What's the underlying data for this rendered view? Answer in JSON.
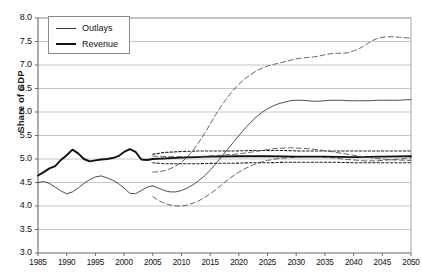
{
  "chart_data": {
    "type": "line",
    "title": "",
    "xlabel": "",
    "ylabel": "Share of GDP",
    "xlim": [
      1985,
      2050
    ],
    "ylim": [
      3.0,
      8.0
    ],
    "ytick_labels": [
      "3.0",
      "3.5",
      "4.0",
      "4.5",
      "5.0",
      "5.5",
      "6.0",
      "6.5",
      "7.0",
      "7.5",
      "8.0"
    ],
    "ytick_values": [
      3.0,
      3.5,
      4.0,
      4.5,
      5.0,
      5.5,
      6.0,
      6.5,
      7.0,
      7.5,
      8.0
    ],
    "xtick_labels": [
      "1985",
      "1990",
      "1995",
      "2000",
      "2005",
      "2010",
      "2015",
      "2020",
      "2025",
      "2030",
      "2035",
      "2040",
      "2045",
      "2050"
    ],
    "xtick_values": [
      1985,
      1990,
      1995,
      2000,
      2005,
      2010,
      2015,
      2020,
      2025,
      2030,
      2035,
      2040,
      2045,
      2050
    ],
    "grid": true,
    "legend_position": "top-left",
    "legend": [
      {
        "label": "Outlays",
        "style": "thin-solid",
        "color": "#333333"
      },
      {
        "label": "Revenue",
        "style": "thick-solid",
        "color": "#111111"
      }
    ],
    "series": [
      {
        "name": "Outlays",
        "style": "thin-solid",
        "color": "#3a3a3a",
        "x": [
          1985,
          1986,
          1987,
          1988,
          1989,
          1990,
          1991,
          1992,
          1993,
          1994,
          1995,
          1996,
          1997,
          1998,
          1999,
          2000,
          2001,
          2002,
          2003,
          2004,
          2005
        ],
        "values": [
          4.5,
          4.52,
          4.48,
          4.4,
          4.32,
          4.26,
          4.3,
          4.38,
          4.48,
          4.56,
          4.62,
          4.64,
          4.6,
          4.55,
          4.48,
          4.38,
          4.27,
          4.26,
          4.33,
          4.4,
          4.43
        ]
      },
      {
        "name": "Outlays projected (mid)",
        "style": "thin-solid",
        "color": "#3a3a3a",
        "x": [
          2005,
          2006,
          2007,
          2008,
          2009,
          2010,
          2011,
          2012,
          2013,
          2014,
          2015,
          2016,
          2017,
          2018,
          2019,
          2020,
          2021,
          2022,
          2023,
          2024,
          2025,
          2026,
          2027,
          2028,
          2029,
          2030,
          2031,
          2032,
          2033,
          2034,
          2035,
          2036,
          2037,
          2038,
          2039,
          2040,
          2041,
          2042,
          2043,
          2044,
          2045,
          2046,
          2047,
          2048,
          2049,
          2050
        ],
        "values": [
          4.43,
          4.38,
          4.33,
          4.3,
          4.3,
          4.33,
          4.38,
          4.45,
          4.54,
          4.64,
          4.76,
          4.9,
          5.05,
          5.2,
          5.35,
          5.5,
          5.64,
          5.77,
          5.89,
          5.99,
          6.07,
          6.13,
          6.18,
          6.21,
          6.24,
          6.25,
          6.25,
          6.24,
          6.23,
          6.23,
          6.24,
          6.25,
          6.25,
          6.25,
          6.24,
          6.24,
          6.24,
          6.24,
          6.24,
          6.25,
          6.25,
          6.25,
          6.25,
          6.25,
          6.26,
          6.26
        ]
      },
      {
        "name": "Outlays projected upper (dashed)",
        "style": "long-dash",
        "color": "#555555",
        "x": [
          2005,
          2006,
          2007,
          2008,
          2009,
          2010,
          2011,
          2012,
          2013,
          2014,
          2015,
          2016,
          2017,
          2018,
          2019,
          2020,
          2021,
          2022,
          2023,
          2024,
          2025,
          2026,
          2027,
          2028,
          2029,
          2030,
          2031,
          2032,
          2033,
          2034,
          2035,
          2036,
          2037,
          2038,
          2039,
          2040,
          2041,
          2042,
          2043,
          2044,
          2045,
          2046,
          2047,
          2048,
          2049,
          2050
        ],
        "values": [
          4.72,
          4.73,
          4.75,
          4.79,
          4.85,
          4.93,
          5.04,
          5.18,
          5.35,
          5.54,
          5.74,
          5.95,
          6.14,
          6.31,
          6.46,
          6.59,
          6.7,
          6.79,
          6.87,
          6.93,
          6.98,
          7.01,
          7.04,
          7.07,
          7.1,
          7.13,
          7.15,
          7.16,
          7.17,
          7.19,
          7.22,
          7.24,
          7.25,
          7.25,
          7.26,
          7.3,
          7.35,
          7.42,
          7.5,
          7.56,
          7.59,
          7.6,
          7.6,
          7.59,
          7.58,
          7.57
        ]
      },
      {
        "name": "Outlays projected lower (dashed)",
        "style": "long-dash",
        "color": "#555555",
        "x": [
          2005,
          2006,
          2007,
          2008,
          2009,
          2010,
          2011,
          2012,
          2013,
          2014,
          2015,
          2016,
          2017,
          2018,
          2019,
          2020,
          2021,
          2022,
          2023,
          2024,
          2025,
          2026,
          2027,
          2028,
          2029,
          2030,
          2031,
          2032,
          2033,
          2034,
          2035,
          2036,
          2037,
          2038,
          2039,
          2040,
          2041,
          2042,
          2043,
          2044,
          2045,
          2046,
          2047,
          2048,
          2049,
          2050
        ],
        "values": [
          4.2,
          4.12,
          4.06,
          4.02,
          4.0,
          4.0,
          4.02,
          4.06,
          4.11,
          4.18,
          4.26,
          4.35,
          4.45,
          4.55,
          4.64,
          4.72,
          4.79,
          4.85,
          4.9,
          4.94,
          4.97,
          4.99,
          5.01,
          5.02,
          5.03,
          5.04,
          5.05,
          5.05,
          5.05,
          5.05,
          5.04,
          5.03,
          5.02,
          5.0,
          4.99,
          4.98,
          4.97,
          4.96,
          4.96,
          4.96,
          4.97,
          4.98,
          4.99,
          5.0,
          5.01,
          5.02
        ]
      },
      {
        "name": "Revenue",
        "style": "thick-solid",
        "color": "#111111",
        "x": [
          1985,
          1986,
          1987,
          1988,
          1989,
          1990,
          1991,
          1992,
          1993,
          1994,
          1995,
          1996,
          1997,
          1998,
          1999,
          2000,
          2001,
          2002,
          2003,
          2004,
          2005
        ],
        "values": [
          4.65,
          4.72,
          4.8,
          4.85,
          4.98,
          5.08,
          5.2,
          5.12,
          5.0,
          4.95,
          4.97,
          4.99,
          5.0,
          5.02,
          5.06,
          5.15,
          5.21,
          5.15,
          4.99,
          4.98,
          5.0
        ]
      },
      {
        "name": "Revenue projected (mid)",
        "style": "thick-solid",
        "color": "#111111",
        "x": [
          2005,
          2010,
          2015,
          2020,
          2025,
          2030,
          2035,
          2040,
          2045,
          2050
        ],
        "values": [
          5.0,
          5.03,
          5.05,
          5.06,
          5.06,
          5.05,
          5.05,
          5.04,
          5.05,
          5.06
        ]
      },
      {
        "name": "Revenue projected upper (dotted)",
        "style": "short-dash",
        "color": "#222222",
        "x": [
          2005,
          2007,
          2010,
          2013,
          2016,
          2019,
          2022,
          2025,
          2028,
          2031,
          2034,
          2037,
          2040,
          2043,
          2046,
          2050
        ],
        "values": [
          5.1,
          5.14,
          5.16,
          5.17,
          5.17,
          5.17,
          5.18,
          5.18,
          5.18,
          5.17,
          5.17,
          5.17,
          5.17,
          5.17,
          5.17,
          5.17
        ]
      },
      {
        "name": "Revenue projected lower (dotted)",
        "style": "short-dash",
        "color": "#222222",
        "x": [
          2005,
          2007,
          2010,
          2013,
          2016,
          2019,
          2022,
          2025,
          2028,
          2031,
          2034,
          2037,
          2040,
          2043,
          2046,
          2050
        ],
        "values": [
          4.92,
          4.9,
          4.9,
          4.9,
          4.91,
          4.91,
          4.92,
          4.92,
          4.93,
          4.93,
          4.93,
          4.93,
          4.92,
          4.92,
          4.92,
          4.92
        ]
      },
      {
        "name": "Revenue alt band upper (dashed)",
        "style": "long-dash",
        "color": "#555555",
        "x": [
          2005,
          2008,
          2011,
          2014,
          2017,
          2020,
          2023,
          2026,
          2029,
          2032,
          2035,
          2038,
          2041,
          2044,
          2047,
          2050
        ],
        "values": [
          5.06,
          5.05,
          5.05,
          5.06,
          5.08,
          5.11,
          5.16,
          5.22,
          5.24,
          5.22,
          5.18,
          5.12,
          5.06,
          5.01,
          4.98,
          4.97
        ]
      }
    ]
  }
}
